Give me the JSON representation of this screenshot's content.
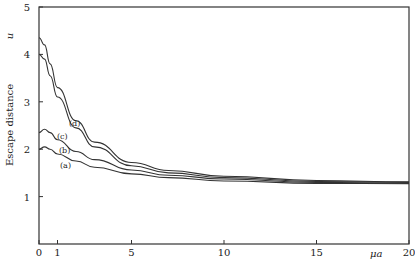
{
  "chart_data": {
    "type": "line",
    "title": "",
    "xlabel": "μa",
    "ylabel": "Escape distance",
    "ylabel_symbol": "u",
    "xlim": [
      0,
      20
    ],
    "ylim": [
      0,
      5
    ],
    "xticks": [
      0,
      1,
      5,
      10,
      15,
      20
    ],
    "yticks": [
      1,
      2,
      3,
      4,
      5
    ],
    "grid": false,
    "legend": "inline curve labels",
    "series": [
      {
        "name": "(a)",
        "x": [
          0,
          0.3,
          0.6,
          1,
          2,
          3,
          5,
          7,
          10,
          15,
          20
        ],
        "values": [
          2.0,
          2.05,
          2.0,
          1.9,
          1.75,
          1.62,
          1.48,
          1.4,
          1.33,
          1.28,
          1.27
        ]
      },
      {
        "name": "(b)",
        "x": [
          0,
          0.3,
          0.6,
          1,
          2,
          3,
          5,
          7,
          10,
          15,
          20
        ],
        "values": [
          2.35,
          2.42,
          2.35,
          2.2,
          1.95,
          1.78,
          1.56,
          1.45,
          1.37,
          1.3,
          1.28
        ]
      },
      {
        "name": "(c)",
        "x": [
          0,
          0.3,
          0.6,
          1,
          2,
          3,
          5,
          7,
          10,
          15,
          20
        ],
        "values": [
          4.0,
          3.9,
          3.55,
          3.1,
          2.45,
          2.05,
          1.65,
          1.5,
          1.4,
          1.32,
          1.3
        ]
      },
      {
        "name": "(d)",
        "x": [
          0,
          0.3,
          0.6,
          1,
          2,
          3,
          5,
          7,
          10,
          15,
          20
        ],
        "values": [
          4.35,
          4.2,
          3.8,
          3.3,
          2.6,
          2.15,
          1.72,
          1.55,
          1.43,
          1.34,
          1.31
        ]
      }
    ]
  },
  "labels": {
    "y_axis_title": "Escape distance",
    "y_symbol": "u",
    "x_symbol": "μa"
  }
}
